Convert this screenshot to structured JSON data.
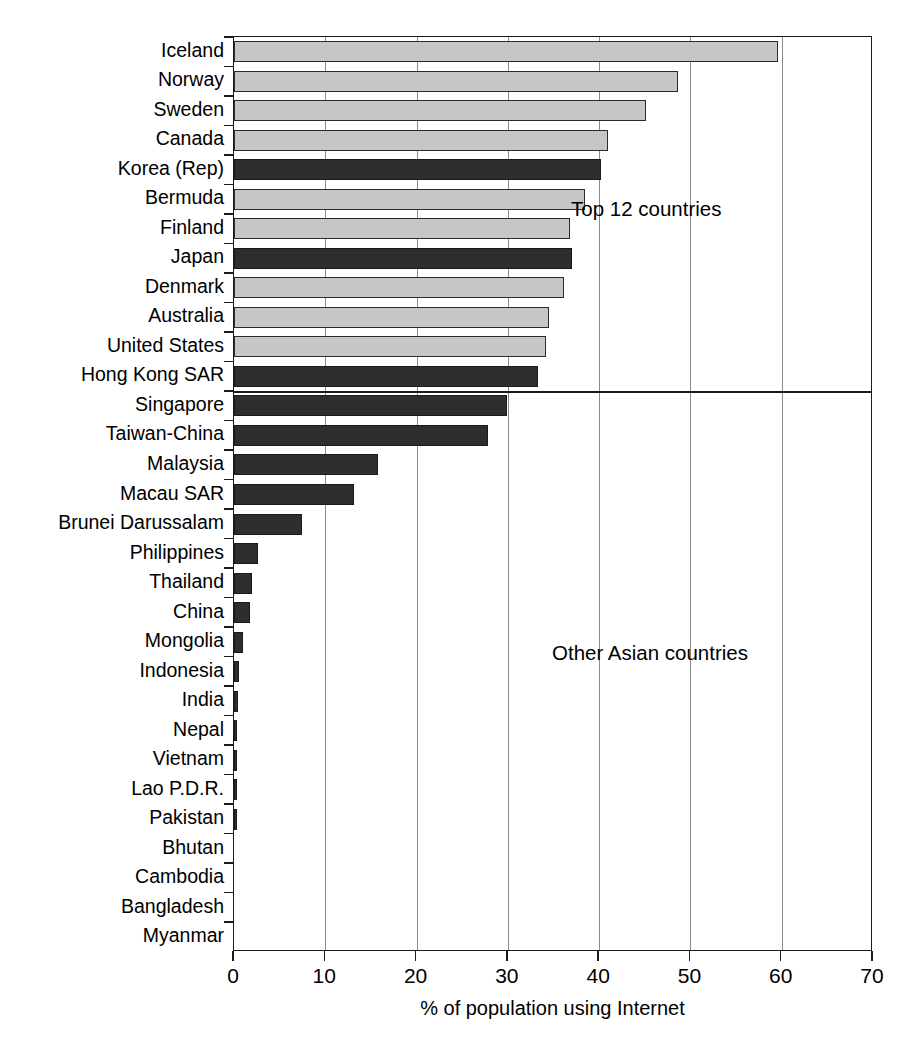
{
  "chart_data": {
    "type": "bar",
    "orientation": "horizontal",
    "title": "",
    "xlabel": "% of population using Internet",
    "ylabel": "",
    "xlim": [
      0,
      70
    ],
    "xticks": [
      0,
      10,
      20,
      30,
      40,
      50,
      60,
      70
    ],
    "grid": "vertical",
    "legend": "none",
    "categories": [
      "Iceland",
      "Norway",
      "Sweden",
      "Canada",
      "Korea (Rep)",
      "Bermuda",
      "Finland",
      "Japan",
      "Denmark",
      "Australia",
      "United States",
      "Hong Kong SAR",
      "Singapore",
      "Taiwan-China",
      "Malaysia",
      "Macau SAR",
      "Brunei Darussalam",
      "Philippines",
      "Thailand",
      "China",
      "Mongolia",
      "Indonesia",
      "India",
      "Nepal",
      "Vietnam",
      "Lao P.D.R.",
      "Pakistan",
      "Bhutan",
      "Cambodia",
      "Bangladesh",
      "Myanmar"
    ],
    "values": [
      59.6,
      48.6,
      45.1,
      41.0,
      40.2,
      38.5,
      36.8,
      37.0,
      36.1,
      34.5,
      34.2,
      33.3,
      29.9,
      27.8,
      15.8,
      13.2,
      7.5,
      2.6,
      2.0,
      1.7,
      1.0,
      0.5,
      0.4,
      0.3,
      0.3,
      0.3,
      0.35,
      0.0,
      0.0,
      0.0,
      0.0
    ],
    "series_groups": [
      "non-asian",
      "non-asian",
      "non-asian",
      "non-asian",
      "asian",
      "non-asian",
      "non-asian",
      "asian",
      "non-asian",
      "non-asian",
      "non-asian",
      "asian",
      "asian",
      "asian",
      "asian",
      "asian",
      "asian",
      "asian",
      "asian",
      "asian",
      "asian",
      "asian",
      "asian",
      "asian",
      "asian",
      "asian",
      "asian",
      "asian",
      "asian",
      "asian",
      "asian"
    ],
    "annotations": [
      {
        "text": "Top 12 countries",
        "x": 46,
        "y_category": "Bermuda"
      },
      {
        "text": "Other Asian countries",
        "x": 44,
        "y_category": "Indonesia"
      }
    ],
    "group_divider_after": "Hong Kong SAR"
  },
  "colors": {
    "bar_non_asian": "#c6c6c6",
    "bar_asian": "#2e2e2e",
    "bar_outline": "#1a1a1a",
    "axis": "#1a1a1a",
    "gridline": "#8c8c8c",
    "background": "#ffffff",
    "text": "#000000"
  }
}
